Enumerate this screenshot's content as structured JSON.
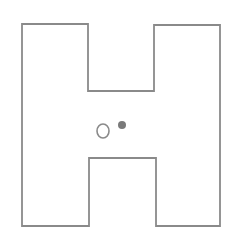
{
  "diagram": {
    "shape": "H-shaped maze outline",
    "stroke_color": "#8a8a8a",
    "background": "#ffffff",
    "outline_points": "22,24 88,24 88,91 154,91 154,25 220,25 220,226 156,226 156,158 89,158 89,226 22,226",
    "markers": [
      {
        "name": "hollow-circle-marker",
        "cx": 103,
        "cy": 131,
        "rx": 6,
        "ry": 7,
        "fill": "none",
        "stroke": "#8a8a8a"
      },
      {
        "name": "filled-dot-marker",
        "cx": 122,
        "cy": 125,
        "r": 4,
        "fill": "#7a7a7a"
      }
    ]
  }
}
